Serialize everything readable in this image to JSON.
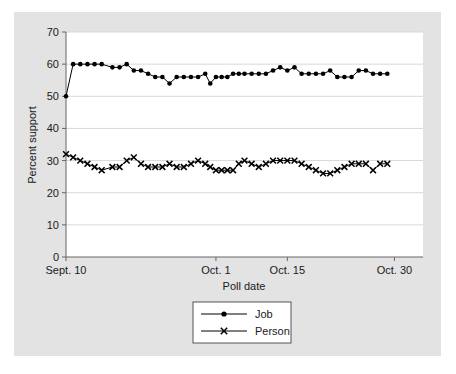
{
  "chart_data": {
    "type": "line",
    "title": "",
    "subtitle": "",
    "xlabel": "Poll date",
    "ylabel": "Percent support",
    "ylim": [
      0,
      70
    ],
    "yticks": [
      0,
      10,
      20,
      30,
      40,
      50,
      60,
      70
    ],
    "ytick_labels": [
      "0",
      "10",
      "20",
      "30",
      "40",
      "50",
      "60",
      "70"
    ],
    "xlim": [
      0,
      50
    ],
    "xticks": [
      0,
      21,
      31,
      46
    ],
    "xtick_labels": [
      "Sept. 10",
      "Oct. 1",
      "Oct. 15",
      "Oct. 30"
    ],
    "grid": "horizontal",
    "legend_position": "below-center",
    "background_color": "#e3e3e3",
    "plot_background_color": "#ffffff",
    "line_color": "#000000",
    "grid_color": "#d8d8d8",
    "series": [
      {
        "name": "Job",
        "marker": "filled-circle",
        "x": [
          0,
          1,
          2,
          3,
          4,
          5,
          6.5,
          7.5,
          8.5,
          9.5,
          10.5,
          11.5,
          12.5,
          13.5,
          14.5,
          15.5,
          16.5,
          17.5,
          18.5,
          19.5,
          20.2,
          21,
          21.8,
          22.6,
          23.4,
          24.2,
          25,
          26,
          27,
          28,
          29,
          30,
          31,
          32,
          33,
          34,
          35,
          36,
          37,
          38,
          39,
          40,
          41,
          42,
          43,
          44,
          45
        ],
        "y": [
          50,
          60,
          60,
          60,
          60,
          60,
          59,
          59,
          60,
          58,
          58,
          57,
          56,
          56,
          54,
          56,
          56,
          56,
          56,
          57,
          54,
          56,
          56,
          56,
          57,
          57,
          57,
          57,
          57,
          57,
          58,
          59,
          58,
          59,
          57,
          57,
          57,
          57,
          58,
          56,
          56,
          56,
          58,
          58,
          57,
          57,
          57
        ]
      },
      {
        "name": "Person",
        "marker": "x-cross",
        "x": [
          0,
          1,
          2,
          3,
          4,
          5,
          6.5,
          7.5,
          8.5,
          9.5,
          10.5,
          11.5,
          12.5,
          13.5,
          14.5,
          15.5,
          16.5,
          17.5,
          18.5,
          19.5,
          20.2,
          21,
          21.8,
          22.6,
          23.4,
          24.2,
          25,
          26,
          27,
          28,
          29,
          30,
          31,
          32,
          33,
          34,
          35,
          36,
          37,
          38,
          39,
          40,
          41,
          42,
          43,
          44,
          45
        ],
        "y": [
          32,
          31,
          30,
          29,
          28,
          27,
          28,
          28,
          30,
          31,
          29,
          28,
          28,
          28,
          29,
          28,
          28,
          29,
          30,
          29,
          28,
          27,
          27,
          27,
          27,
          29,
          30,
          29,
          28,
          29,
          30,
          30,
          30,
          30,
          29,
          28,
          27,
          26,
          26,
          27,
          28,
          29,
          29,
          29,
          27,
          29,
          29
        ]
      }
    ]
  },
  "legend": {
    "items": [
      {
        "label": "Job",
        "marker": "filled-circle"
      },
      {
        "label": "Person",
        "marker": "x-cross"
      }
    ]
  },
  "axes": {
    "y_title": "Percent support",
    "x_title": "Poll date"
  }
}
